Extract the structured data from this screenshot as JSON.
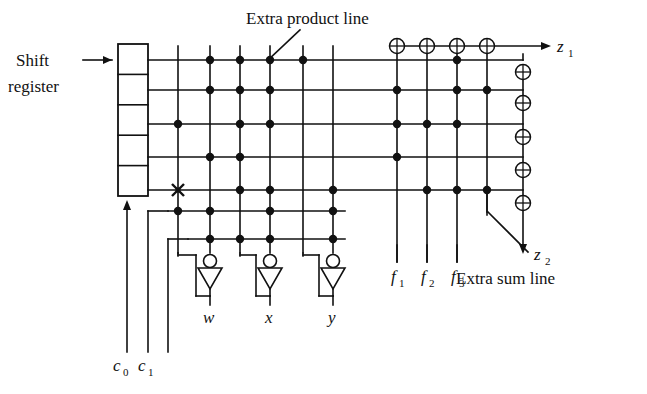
{
  "figure": {
    "type": "pla-logic-array-diagram",
    "title_visible": false,
    "background": "#ffffff",
    "ink": "#111111"
  },
  "labels": {
    "shift_line1": "Shift",
    "shift_line2": "register",
    "extra_product_line": "Extra product line",
    "extra_sum_line": "Extra sum line",
    "z1": "z",
    "z1_sub": "1",
    "z2": "z",
    "z2_sub": "2",
    "c0": "c",
    "c0_sub": "0",
    "c1": "c",
    "c1_sub": "1",
    "w": "w",
    "x": "x",
    "y": "y",
    "f1": "f",
    "f1_sub": "1",
    "f2": "f",
    "f2_sub": "2",
    "f3": "f",
    "f3_sub": "3"
  },
  "shift_register": {
    "cells": 5,
    "x": 118,
    "y": 44,
    "width": 30,
    "height": 152,
    "input_arrow": "left",
    "clock_arrow": "bottom"
  },
  "grid": {
    "row_y": [
      60,
      90,
      124,
      157,
      190,
      211,
      239
    ],
    "product_col_x": [
      178,
      210,
      240,
      270,
      303,
      333
    ],
    "sum_col_x": [
      397,
      427,
      457,
      487
    ],
    "xor_out_col_x": 523
  },
  "xor_gates": {
    "top_row_y": 46,
    "top_row_x": [
      397,
      427,
      457,
      487
    ],
    "right_col_x": 523,
    "right_col_y": [
      72,
      103,
      137,
      170,
      203
    ]
  },
  "inverters": [
    {
      "name": "inverter-w",
      "in_x": 210,
      "out_x": 178,
      "y": 258,
      "label": "w",
      "label_x": 205,
      "label_y": 322
    },
    {
      "name": "inverter-x",
      "in_x": 270,
      "out_x": 240,
      "y": 258,
      "label": "x",
      "label_x": 272,
      "label_y": 322
    },
    {
      "name": "inverter-y",
      "in_x": 333,
      "out_x": 303,
      "y": 258,
      "label": "y",
      "label_x": 335,
      "label_y": 322
    }
  ],
  "connection_dots": {
    "row_0_y": 60,
    "row_0_x": [
      210,
      240,
      270,
      303,
      457
    ],
    "row_1_y": 90,
    "row_1_x": [
      210,
      240,
      270,
      397,
      457,
      487
    ],
    "row_2_y": 124,
    "row_2_x": [
      178,
      240,
      270,
      397,
      427,
      457
    ],
    "row_3_y": 157,
    "row_3_x": [
      210,
      240,
      397
    ],
    "row_4_y": 190,
    "row_4_x": [
      240,
      270,
      333,
      427,
      457,
      487
    ],
    "row_5_y": 211,
    "row_5_x": [
      178,
      210,
      270,
      333
    ],
    "row_6_y": 239,
    "row_6_x": [
      178,
      210,
      240,
      270,
      333
    ]
  },
  "cross_mark": {
    "x": 178,
    "y": 190,
    "note": "crossed connection"
  },
  "bottom_inputs": {
    "c0_x": 127,
    "c1_x": 148,
    "extra_x": 168,
    "bottom_y": 352
  },
  "leaders": {
    "extra_product": {
      "from_x": 300,
      "from_y": 30,
      "to_x": 268,
      "to_y": 60
    },
    "extra_sum": {
      "from_x": 488,
      "from_y": 212,
      "to_x": 528,
      "to_y": 252
    }
  }
}
